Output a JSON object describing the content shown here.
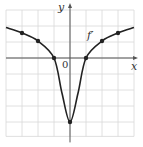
{
  "chart_data": {
    "type": "line",
    "title": "",
    "xlabel": "x",
    "ylabel": "y",
    "origin_label": "0",
    "xlim": [
      -4,
      4
    ],
    "ylim": [
      -4.9,
      3
    ],
    "grid": true,
    "grid_step": 1,
    "series": [
      {
        "name": "f'",
        "label": "f′",
        "color": "#222222",
        "x": [
          -4,
          -3,
          -2,
          -1,
          -0.5,
          0,
          0.5,
          1,
          2,
          3,
          4
        ],
        "y": [
          1.9,
          1.56,
          1.06,
          0,
          -2.2,
          -4,
          -2.2,
          0,
          1.06,
          1.56,
          1.9
        ],
        "marked_points": [
          {
            "x": -3,
            "y": 1.56
          },
          {
            "x": -2,
            "y": 1.06
          },
          {
            "x": -1,
            "y": 0
          },
          {
            "x": 0,
            "y": -4
          },
          {
            "x": 1,
            "y": 0
          },
          {
            "x": 2,
            "y": 1.06
          },
          {
            "x": 3,
            "y": 1.56
          }
        ]
      }
    ]
  },
  "labels": {
    "y_axis": "y",
    "x_axis": "x",
    "origin": "0",
    "curve": "f′"
  },
  "colors": {
    "grid": "#d8d8d8",
    "axis": "#555555",
    "curve": "#222222",
    "background": "#ffffff"
  }
}
